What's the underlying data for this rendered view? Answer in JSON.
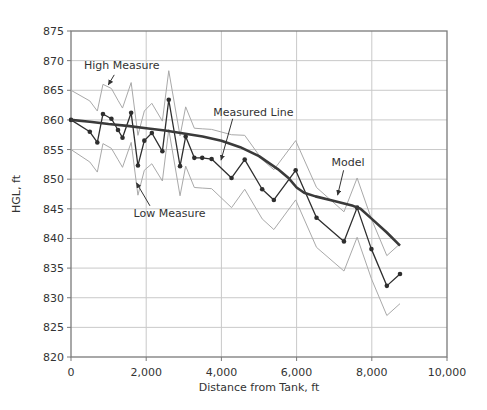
{
  "figure": {
    "background": "#ffffff",
    "text_color": "#333333",
    "axis_color": "#7a7a7a",
    "grid_color": "#c9c9c9"
  },
  "chart_data": {
    "type": "line",
    "title": "",
    "xlabel": "Distance from Tank, ft",
    "ylabel": "HGL, ft",
    "xlim": [
      0,
      10000
    ],
    "ylim": [
      820,
      875
    ],
    "x_ticks": [
      0,
      2000,
      4000,
      6000,
      8000,
      10000
    ],
    "x_tick_labels": [
      "0",
      "2,000",
      "4,000",
      "6,000",
      "8,000",
      "10,000"
    ],
    "y_ticks": [
      820,
      825,
      830,
      835,
      840,
      845,
      850,
      855,
      860,
      865,
      870,
      875
    ],
    "grid": true,
    "legend_position": "none",
    "x": [
      0,
      500,
      700,
      850,
      1075,
      1250,
      1370,
      1600,
      1780,
      1950,
      2150,
      2430,
      2600,
      2900,
      3050,
      3280,
      3490,
      3740,
      4270,
      4620,
      5085,
      5395,
      5975,
      6530,
      7260,
      7610,
      7990,
      8400,
      8750
    ],
    "series": [
      {
        "name": "High Measure",
        "color": "#a9a9a9",
        "line_width": 1,
        "markers": false,
        "values": [
          865,
          863.2,
          861.5,
          866,
          865.3,
          863.3,
          862,
          866.3,
          857.4,
          861.5,
          862.8,
          859.8,
          868.3,
          857.3,
          862.2,
          858.6,
          858.5,
          858.4,
          857.5,
          857.4,
          853.3,
          851.6,
          856.5,
          848.6,
          844.5,
          850.2,
          843.3,
          837.1,
          839.1
        ]
      },
      {
        "name": "Low Measure",
        "color": "#a9a9a9",
        "line_width": 1,
        "markers": false,
        "values": [
          855,
          852.9,
          851.2,
          856,
          855.2,
          853.3,
          852,
          856.2,
          847.3,
          851.5,
          852.6,
          849.7,
          858.4,
          847.2,
          852.2,
          848.6,
          848.5,
          848.4,
          845.2,
          848.3,
          843.3,
          841.5,
          846.5,
          838.5,
          834.5,
          840.2,
          833.2,
          827,
          829
        ]
      },
      {
        "name": "Measured Line",
        "color": "#2e2e2e",
        "line_width": 1.3,
        "markers": true,
        "marker_radius": 2.3,
        "values": [
          860,
          858,
          856.2,
          861,
          860.2,
          858.3,
          857,
          861.2,
          852.3,
          856.5,
          857.8,
          854.7,
          863.4,
          852.2,
          857.2,
          853.6,
          853.6,
          853.4,
          850.2,
          853.3,
          848.3,
          846.5,
          851.5,
          843.5,
          839.5,
          845.2,
          838.2,
          832,
          834
        ]
      },
      {
        "name": "Model",
        "color": "#3a3a3a",
        "line_width": 2.6,
        "markers": false,
        "x": [
          0,
          500,
          1000,
          1500,
          2000,
          2500,
          3000,
          3500,
          4000,
          4500,
          5000,
          5500,
          5800,
          6000,
          6200,
          6500,
          7000,
          7500,
          7700,
          8000,
          8400,
          8750
        ],
        "values": [
          860,
          859.7,
          859.3,
          859,
          858.6,
          858.2,
          857.7,
          857.2,
          856.5,
          855.4,
          853.9,
          851.7,
          850.1,
          848.6,
          847.7,
          847.1,
          846.3,
          845.5,
          845,
          843.3,
          841,
          838.8
        ]
      }
    ],
    "annotations": [
      {
        "text": "High Measure",
        "text_x": 1350,
        "text_y": 869.2,
        "arrow_from_x": 1150,
        "arrow_from_y": 867.6,
        "arrow_to_x": 990,
        "arrow_to_y": 865.9
      },
      {
        "text": "Measured Line",
        "text_x": 4850,
        "text_y": 861.3,
        "arrow_from_x": 4300,
        "arrow_from_y": 860.2,
        "arrow_to_x": 3990,
        "arrow_to_y": 853.2
      },
      {
        "text": "Low Measure",
        "text_x": 2620,
        "text_y": 844.3,
        "arrow_from_x": 2100,
        "arrow_from_y": 845.5,
        "arrow_to_x": 1740,
        "arrow_to_y": 849.4
      },
      {
        "text": "Model",
        "text_x": 7370,
        "text_y": 852.9,
        "arrow_from_x": 7250,
        "arrow_from_y": 851.5,
        "arrow_to_x": 7090,
        "arrow_to_y": 847.3
      }
    ]
  }
}
